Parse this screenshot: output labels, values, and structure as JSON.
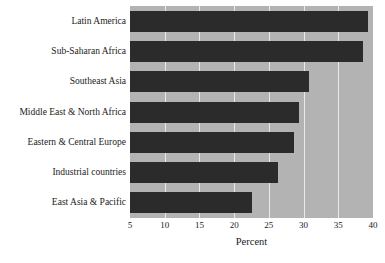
{
  "chart_data": {
    "type": "bar",
    "orientation": "horizontal",
    "title": "",
    "xlabel": "Percent",
    "ylabel": "",
    "xlim": [
      5,
      40
    ],
    "xticks": [
      5,
      10,
      15,
      20,
      25,
      30,
      35,
      40
    ],
    "grid": true,
    "legend": false,
    "categories": [
      "Latin America",
      "Sub-Saharan Africa",
      "Southeast Asia",
      "Middle East & North Africa",
      "Eastern & Central Europe",
      "Industrial countries",
      "East Asia & Pacific"
    ],
    "values": [
      39.3,
      38.6,
      30.8,
      29.3,
      28.6,
      26.3,
      22.5
    ],
    "colors": {
      "bar": "#2b2b2b",
      "plot_background": "#b3b3b3",
      "gridline": "#e9e9e9",
      "text": "#1b1b1b",
      "page_background": "#ffffff"
    }
  }
}
